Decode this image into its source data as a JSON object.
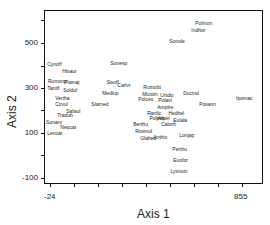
{
  "chart_data": {
    "type": "scatter",
    "title": "",
    "xlabel": "Axis 1",
    "ylabel": "Axis 2",
    "xlim": [
      -24,
      855
    ],
    "ylim": [
      -110,
      705
    ],
    "x_tick_labels": [
      "-24",
      "855"
    ],
    "x_ticks_count": 9,
    "y_tick_labels": [
      "500",
      "300",
      "100",
      "-100"
    ],
    "y_ticks": [
      600,
      500,
      400,
      300,
      200,
      100,
      0,
      -100
    ],
    "grid": false,
    "legend": null,
    "marker": "text-label-only",
    "points": [
      {
        "label": "Polmon",
        "x": 641,
        "y": 585
      },
      {
        "label": "Indhor",
        "x": 623,
        "y": 554
      },
      {
        "label": "Sonole",
        "x": 522,
        "y": 505
      },
      {
        "label": "Cynoff",
        "x": -37,
        "y": 403
      },
      {
        "label": "Hisaur",
        "x": 32,
        "y": 372
      },
      {
        "label": "Sonesp",
        "x": 252,
        "y": 407
      },
      {
        "label": "Rumonp",
        "x": -33,
        "y": 327
      },
      {
        "label": "Plamaj",
        "x": 41,
        "y": 323
      },
      {
        "label": "Sisoff",
        "x": 234,
        "y": 323
      },
      {
        "label": "Carlvr",
        "x": 284,
        "y": 310
      },
      {
        "label": "Tarofl",
        "x": -37,
        "y": 296
      },
      {
        "label": "Soldul",
        "x": 37,
        "y": 287
      },
      {
        "label": "Medlup",
        "x": 215,
        "y": 274
      },
      {
        "label": "Rumobt",
        "x": 403,
        "y": 301
      },
      {
        "label": "Micsim",
        "x": 398,
        "y": 270
      },
      {
        "label": "Urtdio",
        "x": 481,
        "y": 265
      },
      {
        "label": "Polces",
        "x": 380,
        "y": 247
      },
      {
        "label": "Ducind",
        "x": 586,
        "y": 278
      },
      {
        "label": "Ipomac",
        "x": 828,
        "y": 252
      },
      {
        "label": "Vertha",
        "x": 0,
        "y": 252
      },
      {
        "label": "Polavi",
        "x": 472,
        "y": 243
      },
      {
        "label": "Cirvul",
        "x": 0,
        "y": 225
      },
      {
        "label": "Posann",
        "x": 659,
        "y": 225
      },
      {
        "label": "Stamed",
        "x": 165,
        "y": 225
      },
      {
        "label": "Amptre",
        "x": 467,
        "y": 212
      },
      {
        "label": "Safaul",
        "x": 50,
        "y": 198
      },
      {
        "label": "Hedhel",
        "x": 518,
        "y": 185
      },
      {
        "label": "Tradub",
        "x": 9,
        "y": 176
      },
      {
        "label": "Ranfic",
        "x": 421,
        "y": 185
      },
      {
        "label": "Polpes",
        "x": 431,
        "y": 163
      },
      {
        "label": "Allpet",
        "x": 467,
        "y": 163
      },
      {
        "label": "Eulala",
        "x": 540,
        "y": 154
      },
      {
        "label": "Sonarv",
        "x": -42,
        "y": 149
      },
      {
        "label": "Calorb",
        "x": 485,
        "y": 136
      },
      {
        "label": "Berthu",
        "x": 357,
        "y": 136
      },
      {
        "label": "Nepcat",
        "x": 23,
        "y": 123
      },
      {
        "label": "Rosmul",
        "x": 366,
        "y": 109
      },
      {
        "label": "Lonjap",
        "x": 568,
        "y": 91
      },
      {
        "label": "Lencar",
        "x": -37,
        "y": 100
      },
      {
        "label": "Anthis",
        "x": 449,
        "y": 82
      },
      {
        "label": "Glahed",
        "x": 389,
        "y": 74
      },
      {
        "label": "Perthu",
        "x": 536,
        "y": 29
      },
      {
        "label": "Euofor",
        "x": 540,
        "y": -20
      },
      {
        "label": "Lysnum",
        "x": 527,
        "y": -69
      }
    ]
  }
}
